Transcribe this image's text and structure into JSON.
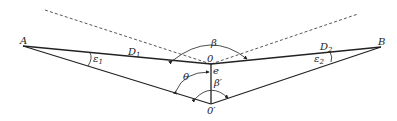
{
  "diagram": {
    "points": {
      "A": {
        "label": "A",
        "x": 23,
        "y": 46
      },
      "B": {
        "label": "B",
        "x": 381,
        "y": 47
      },
      "O": {
        "label": "0",
        "x": 211,
        "y": 64
      },
      "O_prime": {
        "label": "0'",
        "x": 211,
        "y": 104
      }
    },
    "labels": {
      "A": "A",
      "B": "B",
      "O": "0",
      "O_prime": "0′",
      "D1_main": "D",
      "D1_sub": "1",
      "D2_main": "D",
      "D2_sub": "2",
      "eps1_main": "ε",
      "eps1_sub": "1",
      "eps2_main": "ε",
      "eps2_sub": "2",
      "beta": "β",
      "beta_prime": "β′",
      "theta": "θ",
      "e": "e"
    },
    "colors": {
      "line": "#222222",
      "dashed": "#444444",
      "background": "#ffffff"
    }
  }
}
